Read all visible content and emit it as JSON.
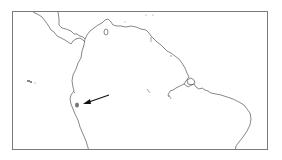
{
  "map": {
    "region": "Northern South America",
    "colors": {
      "frame": "#7a7a7a",
      "coastline": "#555555",
      "marker": "#777777",
      "arrow": "#111111",
      "background": "#ffffff"
    },
    "marker": {
      "shape": "filled-ellipse",
      "x": 75,
      "y": 103
    },
    "arrow": {
      "from": [
        108,
        94
      ],
      "to": [
        82,
        102
      ],
      "direction": "pointing-left-down"
    },
    "features": [
      "Central America isthmus",
      "Caribbean coast",
      "Galápagos Islands",
      "Amazon delta",
      "Atlantic coast of Brazil",
      "Pacific coast of Ecuador/Peru"
    ]
  }
}
